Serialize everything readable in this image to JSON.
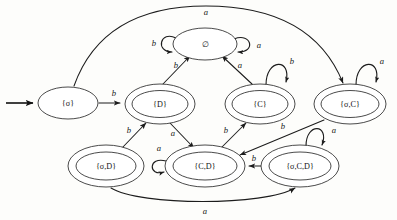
{
  "diagram": {
    "type": "state-machine",
    "alphabet": [
      "a",
      "b"
    ],
    "start_state": "{σ}",
    "colors": {
      "stroke": "#1c1c1c",
      "background": "#fdfdfb",
      "text": "#141414"
    },
    "states": [
      {
        "id": "sigma",
        "label": "{σ}",
        "x": 68,
        "y": 103,
        "rx": 30,
        "ry": 16,
        "accepting": false
      },
      {
        "id": "empty",
        "label": "∅",
        "x": 205,
        "y": 44,
        "rx": 32,
        "ry": 16,
        "accepting": false
      },
      {
        "id": "D",
        "label": "{D}",
        "x": 160,
        "y": 104,
        "rx": 35,
        "ry": 20,
        "accepting": true
      },
      {
        "id": "C",
        "label": "{C}",
        "x": 260,
        "y": 104,
        "rx": 35,
        "ry": 20,
        "accepting": true
      },
      {
        "id": "sigmaC",
        "label": "{σ,C}",
        "x": 350,
        "y": 104,
        "rx": 36,
        "ry": 20,
        "accepting": true
      },
      {
        "id": "sigmaD",
        "label": "{σ,D}",
        "x": 106,
        "y": 166,
        "rx": 38,
        "ry": 21,
        "accepting": true
      },
      {
        "id": "CD",
        "label": "{C,D}",
        "x": 205,
        "y": 166,
        "rx": 40,
        "ry": 21,
        "accepting": true
      },
      {
        "id": "sigmaCD",
        "label": "{σ,C,D}",
        "x": 300,
        "y": 166,
        "rx": 39,
        "ry": 21,
        "accepting": true
      }
    ],
    "transitions": [
      {
        "from": "start",
        "to": "sigma",
        "label": "",
        "kind": "start-arrow"
      },
      {
        "from": "sigma",
        "to": "D",
        "label": "b",
        "kind": "straight",
        "label_x": 114,
        "label_y": 95
      },
      {
        "from": "sigma",
        "to": "sigmaC",
        "label": "a",
        "kind": "top-arc",
        "label_x": 206,
        "label_y": 13
      },
      {
        "from": "D",
        "to": "empty",
        "label": "b",
        "kind": "straight",
        "label_x": 178,
        "label_y": 68
      },
      {
        "from": "C",
        "to": "empty",
        "label": "a",
        "kind": "straight",
        "label_x": 238,
        "label_y": 68
      },
      {
        "from": "empty",
        "to": "empty",
        "label": "b",
        "kind": "loop-left",
        "label_x": 155,
        "label_y": 44
      },
      {
        "from": "empty",
        "to": "empty",
        "label": "a",
        "kind": "loop-right",
        "label_x": 257,
        "label_y": 46
      },
      {
        "from": "C",
        "to": "C",
        "label": "b",
        "kind": "loop-top",
        "label_x": 291,
        "label_y": 64
      },
      {
        "from": "sigmaC",
        "to": "sigmaC",
        "label": "a",
        "kind": "loop-top",
        "label_x": 381,
        "label_y": 64
      },
      {
        "from": "sigmaD",
        "to": "D",
        "label": "b",
        "kind": "straight",
        "label_x": 131,
        "label_y": 132
      },
      {
        "from": "D",
        "to": "CD",
        "label": "a",
        "kind": "straight",
        "label_x": 174,
        "label_y": 135
      },
      {
        "from": "CD",
        "to": "C",
        "label": "b",
        "kind": "straight",
        "label_x": 227,
        "label_y": 132
      },
      {
        "from": "sigmaC",
        "to": "CD",
        "label": "b",
        "kind": "straight",
        "label_x": 281,
        "label_y": 127
      },
      {
        "from": "CD",
        "to": "CD",
        "label": "a",
        "kind": "loop-left",
        "label_x": 159,
        "label_y": 150
      },
      {
        "from": "sigmaCD",
        "to": "CD",
        "label": "b",
        "kind": "straight",
        "label_x": 253,
        "label_y": 162
      },
      {
        "from": "sigmaCD",
        "to": "sigmaCD",
        "label": "a",
        "kind": "loop-top",
        "label_x": 333,
        "label_y": 132
      },
      {
        "from": "sigmaD",
        "to": "sigmaCD",
        "label": "a",
        "kind": "bottom-arc",
        "label_x": 205,
        "label_y": 212
      }
    ]
  }
}
